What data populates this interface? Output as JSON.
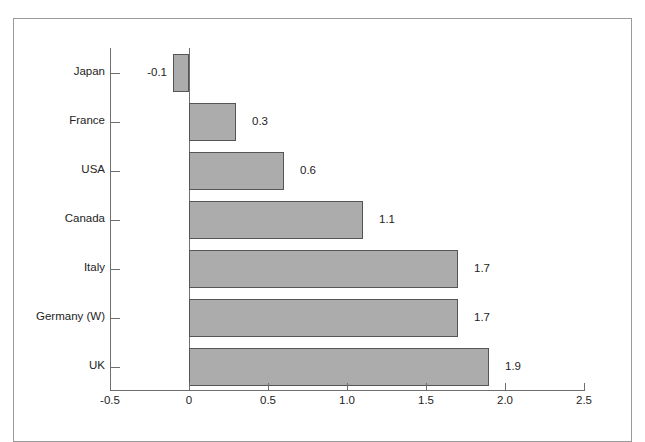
{
  "chart_data": {
    "type": "bar",
    "orientation": "horizontal",
    "title": "",
    "subtitle": "",
    "xlabel": "",
    "ylabel": "",
    "categories": [
      "Japan",
      "France",
      "USA",
      "Canada",
      "Italy",
      "Germany (W)",
      "UK"
    ],
    "values": [
      -0.1,
      0.3,
      0.6,
      1.1,
      1.7,
      1.7,
      1.9
    ],
    "value_labels": [
      "-0.1",
      "0.3",
      "0.6",
      "1.1",
      "1.7",
      "1.7",
      "1.9"
    ],
    "xlim": [
      -0.5,
      2.5
    ],
    "xticks": [
      -0.5,
      0,
      0.5,
      1.0,
      1.5,
      2.0,
      2.5
    ],
    "xtick_labels": [
      "-0.5",
      "0",
      "0.5",
      "1.0",
      "1.5",
      "2.0",
      "2.5"
    ],
    "grid": false,
    "legend": null,
    "legend_position": "none",
    "bar_fill_color": "#acacac",
    "bar_edge_color": "#555555",
    "axis_color": "#6f6f6f",
    "text_color": "#232323",
    "frame_color": "#9a9a9a",
    "background_color": "#ffffff"
  },
  "geometry": {
    "zero_x": 189,
    "px_per_unit": 158,
    "axis_y": 390,
    "plot_top": 48,
    "bar_height": 38,
    "row_pitch": 49
  }
}
